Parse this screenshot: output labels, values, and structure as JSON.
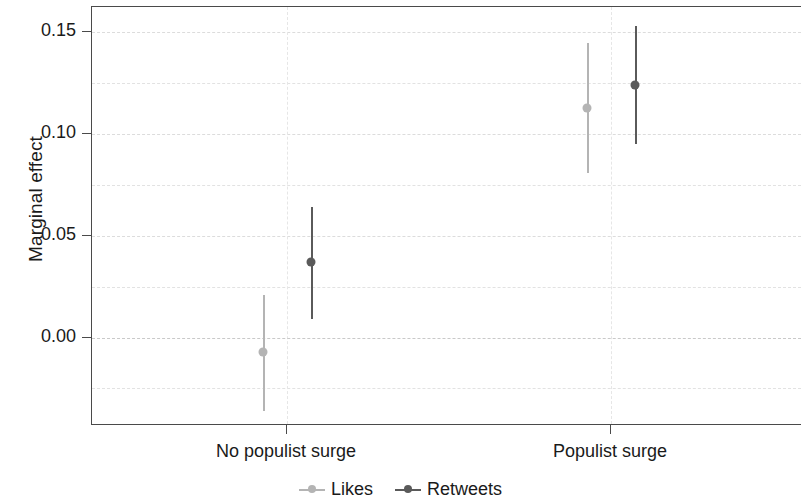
{
  "chart_data": {
    "type": "scatter",
    "title": "",
    "subtitle": "",
    "xlabel": "",
    "ylabel": "Marginal effect",
    "categories": [
      "No populist surge",
      "Populist surge"
    ],
    "ylim": [
      -0.0435,
      0.1625
    ],
    "yticks": [
      0.0,
      0.05,
      0.1,
      0.15
    ],
    "ytick_labels": [
      "0.00",
      "0.05",
      "0.10",
      "0.15"
    ],
    "minor_gridlines": [
      -0.025,
      0.025,
      0.075,
      0.125
    ],
    "grid": true,
    "zero_reference_line": 0.0,
    "legend_position": "bottom",
    "series": [
      {
        "name": "Likes",
        "color": "#b4b4b4",
        "values": [
          -0.007,
          0.113
        ],
        "ci_low": [
          -0.036,
          0.081
        ],
        "ci_high": [
          0.021,
          0.145
        ]
      },
      {
        "name": "Retweets",
        "color": "#5a5a5a",
        "values": [
          0.037,
          0.124
        ],
        "ci_low": [
          0.009,
          0.095
        ],
        "ci_high": [
          0.064,
          0.153
        ]
      }
    ]
  },
  "axis": {
    "y_label": "Marginal effect",
    "y_tick_labels": [
      "0.15",
      "0.10",
      "0.05",
      "0.00"
    ],
    "x_tick_labels": [
      "No populist surge",
      "Populist surge"
    ]
  },
  "legend": {
    "items": [
      {
        "label": "Likes",
        "color": "#b4b4b4"
      },
      {
        "label": "Retweets",
        "color": "#5a5a5a"
      }
    ]
  }
}
